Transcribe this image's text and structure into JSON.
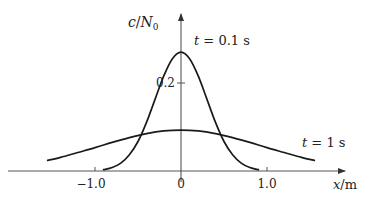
{
  "chart_data": {
    "type": "line",
    "title": "",
    "xlabel": "x/m",
    "ylabel": "c/N0",
    "xlim": [
      -2.1,
      2.2
    ],
    "ylim": [
      0,
      0.31
    ],
    "grid": false,
    "x_ticks": [
      {
        "value": -1.0,
        "label": "−1.0"
      },
      {
        "value": 0,
        "label": "0"
      },
      {
        "value": 1.0,
        "label": "1.0"
      }
    ],
    "y_ticks": [
      {
        "value": 0.2,
        "label": "0.2"
      }
    ],
    "series": [
      {
        "name": "t = 0.1 s",
        "label_parts": {
          "var": "t",
          "rest": " = 0.1 s"
        },
        "x": [
          -0.9,
          -0.8,
          -0.7,
          -0.6,
          -0.5,
          -0.4,
          -0.3,
          -0.2,
          -0.1,
          0,
          0.1,
          0.2,
          0.3,
          0.4,
          0.5,
          0.6,
          0.7,
          0.8,
          0.9
        ],
        "y": [
          0.003,
          0.008,
          0.018,
          0.037,
          0.067,
          0.111,
          0.164,
          0.216,
          0.255,
          0.27,
          0.255,
          0.216,
          0.164,
          0.111,
          0.067,
          0.037,
          0.018,
          0.008,
          0.003
        ]
      },
      {
        "name": "t = 1 s",
        "label_parts": {
          "var": "t",
          "rest": " = 1 s"
        },
        "x": [
          -1.55,
          -1.4,
          -1.2,
          -1.0,
          -0.8,
          -0.6,
          -0.4,
          -0.2,
          0,
          0.2,
          0.4,
          0.6,
          0.8,
          1.0,
          1.2,
          1.4,
          1.55
        ],
        "y": [
          0.024,
          0.031,
          0.042,
          0.053,
          0.065,
          0.076,
          0.085,
          0.091,
          0.093,
          0.091,
          0.085,
          0.076,
          0.065,
          0.053,
          0.042,
          0.031,
          0.024
        ]
      }
    ]
  },
  "labels": {
    "y_axis_var": "c",
    "y_axis_sep": "/",
    "y_axis_N": "N",
    "y_axis_sub": "0",
    "x_axis_var": "x",
    "x_axis_unit": "/m"
  }
}
